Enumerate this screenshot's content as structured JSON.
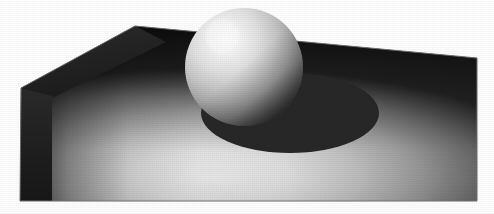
{
  "image": {
    "title": "Sphere resting on a shaded ground plane",
    "kind": "computer-graphics-render",
    "width": 494,
    "height": 214,
    "background_color": "#ffffff",
    "description": "A grayscale ray-traced style rendering of a matte sphere sitting on a flat quadrilateral ground plane, with a hard-edged elliptical cast shadow falling to the lower right of the sphere."
  },
  "scene": {
    "ground_plane": {
      "name": "ground-plane",
      "shape": "quadrilateral-in-perspective",
      "points": "135,26 477,58 477,201 20,201 21,88",
      "outline_color": "#6e6e6e",
      "light_color": "#e8e8e8",
      "mid_color": "#9a9a9a",
      "dark_color": "#272727",
      "darkest_color": "#1c1c1c"
    },
    "left_edge_band": {
      "name": "plane-left-edge-band",
      "points": "21,88 52,96 52,201 20,201",
      "color": "#1e1e1e"
    },
    "back_left_facet": {
      "name": "plane-back-left-facet",
      "points": "135,26 21,88 52,96 160,44",
      "color": "#232323"
    },
    "sphere": {
      "name": "sphere",
      "center_x": 244,
      "center_y": 67,
      "radius": 59,
      "highlight_x": 222,
      "highlight_y": 36,
      "highlight_color": "#fbfbfb",
      "midtone_color": "#b8b8b8",
      "terminator_color": "#595959",
      "dark_color": "#222222",
      "material": "matte-diffuse-gray"
    },
    "cast_shadow": {
      "name": "cast-shadow",
      "center_x": 290,
      "center_y": 113,
      "radius_x": 89,
      "radius_y": 40,
      "color": "#272727",
      "edge": "hard"
    },
    "lighting": {
      "name": "key-light",
      "direction": "upper-left",
      "type": "single point light",
      "shadow_direction": "lower-right"
    }
  },
  "labels": {
    "caption": ""
  }
}
